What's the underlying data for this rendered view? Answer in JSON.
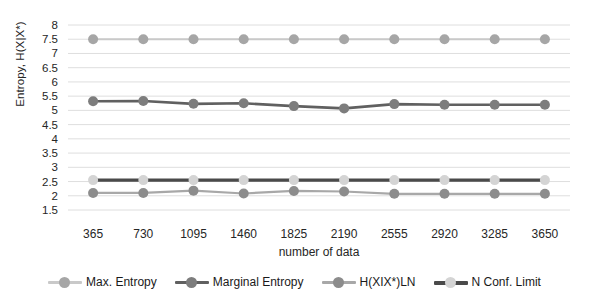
{
  "chart_data": {
    "type": "line",
    "title": "",
    "xlabel": "number of data",
    "ylabel": "Entropy, H(X|X*)",
    "categories": [
      365,
      730,
      1095,
      1460,
      1825,
      2190,
      2555,
      2920,
      3285,
      3650
    ],
    "xtick_labels": [
      "365",
      "730",
      "1095",
      "1460",
      "1825",
      "2190",
      "2555",
      "2920",
      "3285",
      "3650"
    ],
    "ylim": [
      1.5,
      8
    ],
    "ytick_labels": [
      "8",
      "7.5",
      "7",
      "6.5",
      "6",
      "5.5",
      "5",
      "4.5",
      "4",
      "3.5",
      "3",
      "2.5",
      "2",
      "1.5"
    ],
    "yticks": [
      8,
      7.5,
      7,
      6.5,
      6,
      5.5,
      5,
      4.5,
      4,
      3.5,
      3,
      2.5,
      2,
      1.5
    ],
    "grid": true,
    "legend_position": "bottom",
    "series": [
      {
        "name": "Max. Entropy",
        "color": "#c9c9c9",
        "marker_color": "#a6a6a6",
        "values": [
          7.5,
          7.5,
          7.5,
          7.5,
          7.5,
          7.5,
          7.5,
          7.5,
          7.5,
          7.5
        ]
      },
      {
        "name": "Marginal Entropy",
        "color": "#606060",
        "marker_color": "#7d7d7d",
        "values": [
          5.32,
          5.33,
          5.23,
          5.25,
          5.15,
          5.07,
          5.22,
          5.2,
          5.2,
          5.2
        ]
      },
      {
        "name": "H(XIX*)LN",
        "color": "#a8a8a8",
        "marker_color": "#8c8c8c",
        "values": [
          2.1,
          2.1,
          2.18,
          2.08,
          2.17,
          2.15,
          2.07,
          2.07,
          2.07,
          2.07
        ]
      },
      {
        "name": "N Conf. Limit",
        "color": "#4a4a4a",
        "marker_color": "#d4d4d4",
        "values": [
          2.55,
          2.55,
          2.55,
          2.55,
          2.55,
          2.55,
          2.55,
          2.55,
          2.55,
          2.55
        ]
      }
    ]
  },
  "legend": {
    "items": [
      {
        "label": "Max. Entropy"
      },
      {
        "label": "Marginal Entropy"
      },
      {
        "label": "H(XIX*)LN"
      },
      {
        "label": "N Conf. Limit"
      }
    ]
  },
  "colors": {
    "gridline": "#dedede",
    "axis_text": "#262626",
    "background": "#ffffff"
  }
}
